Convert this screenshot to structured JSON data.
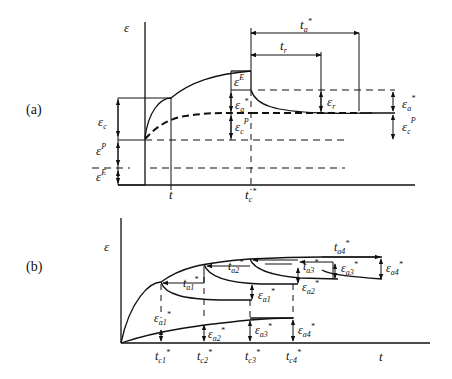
{
  "panel_a": {
    "tag": "(a)",
    "y_axis": "ε",
    "x_tick_t": "t",
    "x_tick_tc": "t",
    "x_tick_tc_sub": "c",
    "star": "*",
    "labels": {
      "eps_c": "ε",
      "eps_c_sub": "c",
      "eps_P": "ε",
      "eps_P_sup": "P",
      "eps_E": "ε",
      "eps_E_sup": "E",
      "eps_E_top": "ε",
      "eps_E_top_sup": "E",
      "eps_a_left": "ε",
      "eps_a_left_sub": "a",
      "eps_cP_left": "ε",
      "eps_cP_left_sub": "c",
      "eps_cP_left_sup": "P",
      "t_a": "t",
      "t_a_sub": "a",
      "t_r": "t",
      "t_r_sub": "r",
      "eps_r": "ε",
      "eps_r_sub": "r",
      "eps_a_right": "ε",
      "eps_a_right_sub": "a",
      "eps_cP_right": "ε",
      "eps_cP_right_sub": "c",
      "eps_cP_right_sup": "P"
    }
  },
  "panel_b": {
    "tag": "(b)",
    "y_axis": "ε",
    "x_axis": "t",
    "star": "*",
    "t_c": [
      {
        "base": "t",
        "sub": "c1"
      },
      {
        "base": "t",
        "sub": "c2"
      },
      {
        "base": "t",
        "sub": "c3"
      },
      {
        "base": "t",
        "sub": "c4"
      }
    ],
    "t_a": [
      {
        "base": "t",
        "sub": "a1"
      },
      {
        "base": "t",
        "sub": "a2"
      },
      {
        "base": "t",
        "sub": "a3"
      },
      {
        "base": "t",
        "sub": "a4"
      }
    ],
    "eps_a_upper": [
      {
        "base": "ε",
        "sub": "a1"
      },
      {
        "base": "ε",
        "sub": "a2"
      },
      {
        "base": "ε",
        "sub": "a3"
      },
      {
        "base": "ε",
        "sub": "a4"
      }
    ],
    "eps_a_lower": [
      {
        "base": "ε",
        "sub": "a1"
      },
      {
        "base": "ε",
        "sub": "a2"
      },
      {
        "base": "ε",
        "sub": "a3"
      },
      {
        "base": "ε",
        "sub": "a4"
      }
    ]
  }
}
